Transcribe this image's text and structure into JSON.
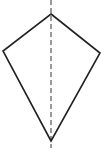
{
  "diagram": {
    "shape": "kite",
    "stroke_color": "#222222",
    "axis_color": "#333333",
    "vertices": {
      "top": [
        51,
        14
      ],
      "left": [
        3,
        51
      ],
      "right": [
        100,
        53
      ],
      "bottom": [
        51,
        141
      ]
    },
    "symmetry_axis": {
      "x": 51,
      "y_start": 0,
      "y_end": 148,
      "style": "dashed"
    }
  }
}
